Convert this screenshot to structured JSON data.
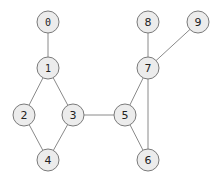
{
  "graph": {
    "node_radius": 11,
    "colors": {
      "node_fill": "#ececec",
      "node_stroke": "#7a7a7a",
      "edge": "#8a8a8a",
      "label": "#222222",
      "background": "#ffffff"
    },
    "nodes": [
      {
        "id": "0",
        "label": "0",
        "x": 48,
        "y": 22,
        "mono": true
      },
      {
        "id": "1",
        "label": "1",
        "x": 48,
        "y": 68,
        "mono": true
      },
      {
        "id": "2",
        "label": "2",
        "x": 24,
        "y": 115,
        "mono": false
      },
      {
        "id": "3",
        "label": "3",
        "x": 73,
        "y": 115,
        "mono": false
      },
      {
        "id": "4",
        "label": "4",
        "x": 48,
        "y": 160,
        "mono": false
      },
      {
        "id": "5",
        "label": "5",
        "x": 125,
        "y": 115,
        "mono": false
      },
      {
        "id": "6",
        "label": "6",
        "x": 148,
        "y": 160,
        "mono": false
      },
      {
        "id": "7",
        "label": "7",
        "x": 148,
        "y": 68,
        "mono": false
      },
      {
        "id": "8",
        "label": "8",
        "x": 148,
        "y": 22,
        "mono": false
      },
      {
        "id": "9",
        "label": "9",
        "x": 198,
        "y": 22,
        "mono": false
      }
    ],
    "edges": [
      [
        "0",
        "1"
      ],
      [
        "1",
        "2"
      ],
      [
        "1",
        "3"
      ],
      [
        "2",
        "4"
      ],
      [
        "3",
        "4"
      ],
      [
        "3",
        "5"
      ],
      [
        "5",
        "7"
      ],
      [
        "5",
        "6"
      ],
      [
        "7",
        "6"
      ],
      [
        "7",
        "8"
      ],
      [
        "7",
        "9"
      ]
    ]
  }
}
